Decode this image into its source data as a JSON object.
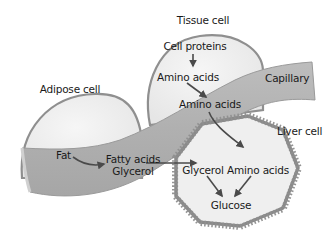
{
  "diagram": {
    "type": "biology-metabolism",
    "colors": {
      "background": "#ffffff",
      "cell_fill": "#efefef",
      "cell_outline": "#8f8f8f",
      "capillary": "#b3b3b3",
      "capillary_edge": "#9a9a9a",
      "arrow": "#4a4a4a",
      "text": "#1a1a1a"
    },
    "cells": {
      "adipose": {
        "title": "Adipose cell",
        "contents": [
          "Fat"
        ]
      },
      "tissue": {
        "title": "Tissue cell",
        "contents": [
          "Cell proteins",
          "Amino acids"
        ]
      },
      "liver": {
        "title": "Liver cell",
        "contents": [
          "Glycerol",
          "Amino acids",
          "Glucose"
        ]
      }
    },
    "capillary": {
      "title": "Capillary",
      "contents": [
        "Fatty acids",
        "Glycerol",
        "Amino acids"
      ]
    },
    "labels": {
      "tissue_cell": "Tissue cell",
      "cell_proteins": "Cell proteins",
      "tissue_amino_acids": "Amino acids",
      "adipose_cell": "Adipose cell",
      "capillary": "Capillary",
      "capillary_amino_acids": "Amino acids",
      "liver_cell": "Liver cell",
      "fat": "Fat",
      "fatty_acids": "Fatty acids",
      "capillary_glycerol": "Glycerol",
      "liver_glycerol": "Glycerol",
      "liver_amino_acids": "Amino acids",
      "glucose": "Glucose"
    },
    "arrows": [
      {
        "from": "Cell proteins",
        "to": "Amino acids (tissue cell)"
      },
      {
        "from": "Amino acids (tissue cell)",
        "to": "Amino acids (capillary)"
      },
      {
        "from": "Fat",
        "to": "Fatty acids / Glycerol (capillary)"
      },
      {
        "from": "Glycerol (capillary)",
        "to": "Glycerol (liver cell)"
      },
      {
        "from": "Amino acids (capillary)",
        "to": "Amino acids (liver cell)"
      },
      {
        "from": "Glycerol (liver cell)",
        "to": "Glucose"
      },
      {
        "from": "Amino acids (liver cell)",
        "to": "Glucose"
      }
    ]
  }
}
